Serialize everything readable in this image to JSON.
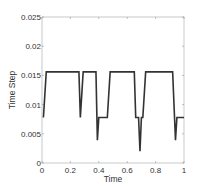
{
  "chart_data": {
    "type": "line",
    "title": "",
    "xlabel": "Time",
    "ylabel": "Time Step",
    "xlim": [
      0,
      1
    ],
    "ylim": [
      0,
      0.025
    ],
    "grid": false,
    "legend": null,
    "x_ticks": [
      0,
      0.2,
      0.4,
      0.6,
      0.8,
      1
    ],
    "x_tick_labels": [
      "0",
      "0.2",
      "0.4",
      "0.6",
      "0.8",
      "1"
    ],
    "y_ticks": [
      0,
      0.005,
      0.01,
      0.015,
      0.02,
      0.025
    ],
    "y_tick_labels": [
      "0",
      "0.005",
      "0.01",
      "0.015",
      "0.02",
      "0.025"
    ],
    "line_color": "#333333",
    "series": [
      {
        "name": "Time Step",
        "x": [
          0.01,
          0.03,
          0.26,
          0.27,
          0.29,
          0.38,
          0.39,
          0.4,
          0.46,
          0.48,
          0.65,
          0.66,
          0.68,
          0.69,
          0.7,
          0.71,
          0.73,
          0.92,
          0.94,
          0.95,
          1.0
        ],
        "y": [
          0.0078,
          0.0156,
          0.0156,
          0.0078,
          0.0156,
          0.0156,
          0.0039,
          0.0078,
          0.0078,
          0.0156,
          0.0156,
          0.0078,
          0.0078,
          0.002,
          0.0078,
          0.0078,
          0.0156,
          0.0156,
          0.0039,
          0.0078,
          0.0078
        ]
      }
    ]
  }
}
